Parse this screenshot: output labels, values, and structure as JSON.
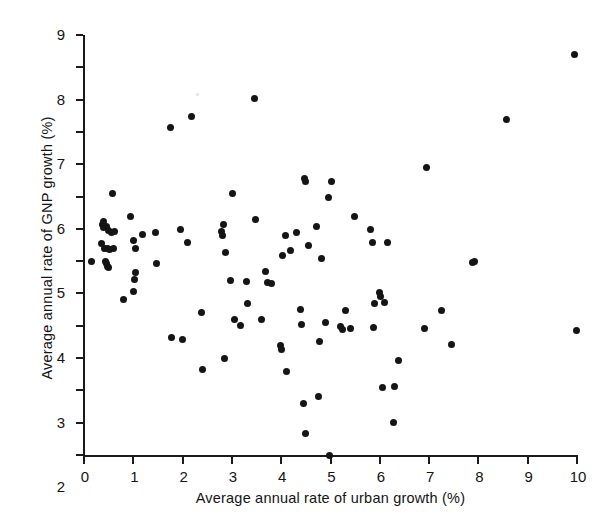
{
  "chart_data": {
    "type": "scatter",
    "title": "",
    "xlabel": "Average annual rate of urban growth (%)",
    "ylabel": "Average annual rate of GNP growth (%)",
    "xlim": [
      0,
      10
    ],
    "ylim": [
      -4,
      9
    ],
    "xticks": [
      0,
      1,
      2,
      3,
      4,
      5,
      6,
      7,
      8,
      9,
      10
    ],
    "yticks": [
      -4,
      -3,
      -2,
      -1,
      0,
      1,
      2,
      3,
      4,
      5,
      6,
      7,
      8,
      9
    ],
    "xtick_labels": [
      "0",
      "1",
      "2",
      "3",
      "4",
      "5",
      "6",
      "7",
      "8",
      "9",
      "10"
    ],
    "ytick_labels": [
      "-4",
      "-3",
      "-2",
      "-1",
      "0",
      "1",
      "2",
      "3",
      "4",
      "5",
      "6",
      "7",
      "8",
      "9"
    ],
    "grid": false,
    "legend": null,
    "marker": "filled-circle",
    "marker_color": "#151515",
    "axis_color": "#1b1b1b",
    "background_color": "#ffffff",
    "n_points": 108,
    "points": [
      [
        0.15,
        2.0
      ],
      [
        0.35,
        2.55
      ],
      [
        0.38,
        3.12
      ],
      [
        0.4,
        3.22
      ],
      [
        0.4,
        3.05
      ],
      [
        0.42,
        2.4
      ],
      [
        0.44,
        1.98
      ],
      [
        0.45,
        1.92
      ],
      [
        0.45,
        3.08
      ],
      [
        0.47,
        2.38
      ],
      [
        0.48,
        1.85
      ],
      [
        0.5,
        1.8
      ],
      [
        0.5,
        2.95
      ],
      [
        0.52,
        2.35
      ],
      [
        0.55,
        2.88
      ],
      [
        0.58,
        4.08
      ],
      [
        0.6,
        2.38
      ],
      [
        0.62,
        2.92
      ],
      [
        0.8,
        0.82
      ],
      [
        0.95,
        3.37
      ],
      [
        1.0,
        1.05
      ],
      [
        1.0,
        2.65
      ],
      [
        1.02,
        1.42
      ],
      [
        1.05,
        1.65
      ],
      [
        1.05,
        2.38
      ],
      [
        1.18,
        2.82
      ],
      [
        1.45,
        2.9
      ],
      [
        1.48,
        1.92
      ],
      [
        1.75,
        6.14
      ],
      [
        1.78,
        -0.35
      ],
      [
        1.95,
        2.98
      ],
      [
        2.0,
        -0.43
      ],
      [
        2.1,
        2.58
      ],
      [
        2.18,
        6.48
      ],
      [
        2.38,
        0.4
      ],
      [
        2.4,
        -1.35
      ],
      [
        2.78,
        2.92
      ],
      [
        2.8,
        2.8
      ],
      [
        2.82,
        3.15
      ],
      [
        2.85,
        -1.02
      ],
      [
        2.88,
        2.28
      ],
      [
        2.98,
        1.4
      ],
      [
        3.02,
        4.08
      ],
      [
        3.05,
        0.18
      ],
      [
        3.18,
        0.0
      ],
      [
        3.3,
        1.38
      ],
      [
        3.32,
        0.68
      ],
      [
        3.45,
        7.05
      ],
      [
        3.48,
        3.3
      ],
      [
        3.6,
        0.18
      ],
      [
        3.68,
        1.68
      ],
      [
        3.72,
        1.35
      ],
      [
        3.8,
        1.32
      ],
      [
        3.98,
        -0.62
      ],
      [
        4.0,
        -0.72
      ],
      [
        4.02,
        2.18
      ],
      [
        4.08,
        2.8
      ],
      [
        4.1,
        -1.42
      ],
      [
        4.18,
        2.32
      ],
      [
        4.32,
        2.88
      ],
      [
        4.4,
        0.5
      ],
      [
        4.42,
        0.05
      ],
      [
        4.45,
        -2.42
      ],
      [
        4.48,
        4.55
      ],
      [
        4.5,
        4.48
      ],
      [
        4.5,
        -3.32
      ],
      [
        4.55,
        2.48
      ],
      [
        4.72,
        3.08
      ],
      [
        4.75,
        -2.18
      ],
      [
        4.78,
        -0.48
      ],
      [
        4.82,
        2.08
      ],
      [
        4.9,
        0.1
      ],
      [
        4.95,
        3.98
      ],
      [
        4.98,
        -4.0
      ],
      [
        5.02,
        4.48
      ],
      [
        5.2,
        -0.02
      ],
      [
        5.25,
        -0.12
      ],
      [
        5.3,
        0.48
      ],
      [
        5.4,
        -0.08
      ],
      [
        5.48,
        3.38
      ],
      [
        5.82,
        2.98
      ],
      [
        5.85,
        2.58
      ],
      [
        5.88,
        -0.05
      ],
      [
        5.9,
        0.68
      ],
      [
        6.0,
        1.02
      ],
      [
        6.02,
        0.92
      ],
      [
        6.05,
        -1.92
      ],
      [
        6.1,
        0.72
      ],
      [
        6.15,
        2.58
      ],
      [
        6.28,
        -3.0
      ],
      [
        6.3,
        -1.88
      ],
      [
        6.38,
        -1.08
      ],
      [
        6.9,
        -0.08
      ],
      [
        6.95,
        4.9
      ],
      [
        7.25,
        0.48
      ],
      [
        7.45,
        -0.58
      ],
      [
        7.88,
        1.95
      ],
      [
        7.92,
        1.98
      ],
      [
        8.58,
        6.38
      ],
      [
        9.95,
        8.4
      ],
      [
        9.98,
        -0.15
      ]
    ]
  }
}
